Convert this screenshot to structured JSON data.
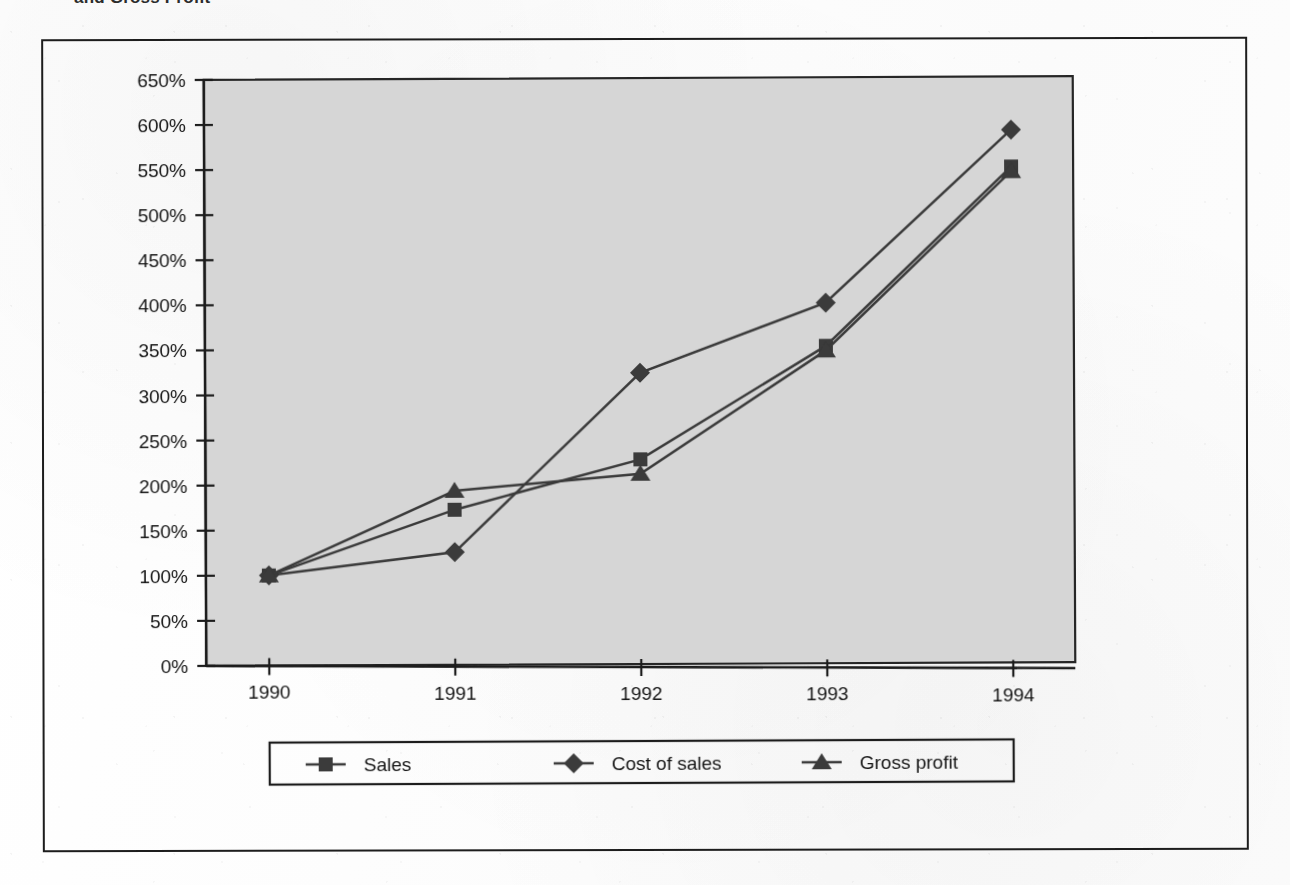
{
  "heading": {
    "text_fragment": "and Gross Profit"
  },
  "chart_data": {
    "type": "line",
    "title": "",
    "xlabel": "",
    "ylabel": "",
    "categories": [
      "1990",
      "1991",
      "1992",
      "1993",
      "1994"
    ],
    "x": [
      1990,
      1991,
      1992,
      1993,
      1994
    ],
    "ylim": [
      0,
      650
    ],
    "ytick_labels": [
      "0%",
      "50%",
      "100%",
      "150%",
      "200%",
      "250%",
      "300%",
      "350%",
      "400%",
      "450%",
      "500%",
      "550%",
      "600%",
      "650%"
    ],
    "ytick_values": [
      0,
      50,
      100,
      150,
      200,
      250,
      300,
      350,
      400,
      450,
      500,
      550,
      600,
      650
    ],
    "grid": false,
    "legend_position": "bottom",
    "plot_background": "#d6d6d6",
    "series": [
      {
        "name": "Sales",
        "marker": "square",
        "color": "#3a3a3a",
        "values": [
          100,
          172,
          227,
          352,
          550
        ]
      },
      {
        "name": "Cost of sales",
        "marker": "diamond",
        "color": "#3a3a3a",
        "values": [
          100,
          125,
          323,
          400,
          591
        ]
      },
      {
        "name": "Gross profit",
        "marker": "triangle",
        "color": "#3a3a3a",
        "values": [
          100,
          193,
          211,
          347,
          545
        ]
      }
    ]
  },
  "legend": {
    "items": [
      {
        "label": "Sales",
        "marker": "square-marker"
      },
      {
        "label": "Cost of sales",
        "marker": "diamond-marker"
      },
      {
        "label": "Gross profit",
        "marker": "triangle-marker"
      }
    ]
  }
}
